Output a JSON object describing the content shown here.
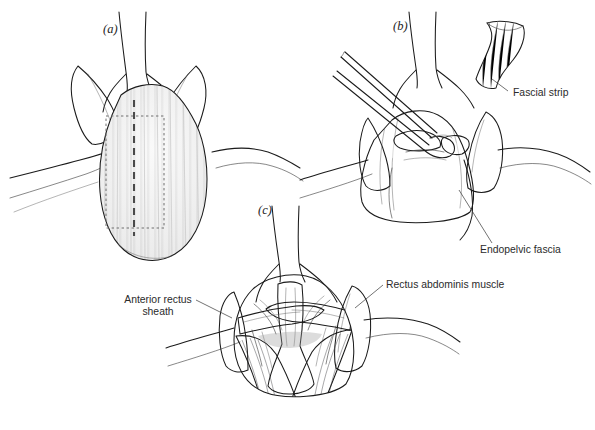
{
  "figure": {
    "kind": "medical-illustration",
    "background_color": "#ffffff",
    "ink_color": "#1b1b1b",
    "label_color": "#2b2b2b",
    "width": 595,
    "height": 430
  },
  "panels": [
    {
      "id": "a",
      "letter": "(a)",
      "letter_x": 103,
      "letter_y": 33,
      "caption_role": "Exposure of anterior rectus sheath with outlined fascial strip to be harvested",
      "features": [
        "anterior rectus sheath",
        "dotted harvest outline",
        "bold dashed midline incision",
        "retracted subcutaneous fat",
        "skin flaps"
      ]
    },
    {
      "id": "b",
      "letter": "(b)",
      "letter_x": 393,
      "letter_y": 30,
      "caption_role": "Harvested fascial strip removed; clamp passed beneath endopelvic fascia",
      "features": [
        "fascial strip specimen",
        "surgical clamp",
        "endopelvic fascia",
        "bladder dome"
      ]
    },
    {
      "id": "c",
      "letter": "(c)",
      "letter_x": 258,
      "letter_y": 214,
      "caption_role": "Fascial slings passed around the urethra between the rectus abdominis muscles",
      "features": [
        "two fascial sling arms crossing urethra",
        "rectus abdominis muscle bellies",
        "anterior rectus sheath edges",
        "urethra and bladder neck"
      ]
    }
  ],
  "annotations": [
    {
      "id": "fascial-strip",
      "text": "Fascial strip",
      "text_x": 513,
      "text_y": 96,
      "anchor": "start",
      "leader": "M 508 91 L 492 79 L 492 79",
      "points_to": "harvested strip of rectus fascia in panel b"
    },
    {
      "id": "endopelvic-fascia",
      "text": "Endopelvic fascia",
      "text_x": 480,
      "text_y": 253,
      "anchor": "start",
      "leader": "M 492 243 L 459 190",
      "points_to": "endopelvic fascia lateral to bladder neck in panel b"
    },
    {
      "id": "anterior-rectus-sheath",
      "text_line_1": "Anterior rectus",
      "text_line_2": "sheath",
      "text_x": 158,
      "text_y": 303,
      "anchor": "middle",
      "leader": "M 196 300 L 232 318",
      "points_to": "cut edge of anterior rectus sheath in panel c"
    },
    {
      "id": "rectus-abdominis-muscle",
      "text": "Rectus abdominis muscle",
      "text_x": 386,
      "text_y": 288,
      "anchor": "start",
      "leader": "M 383 285 L 355 308",
      "points_to": "rectus abdominis muscle belly in panel c"
    }
  ],
  "palette": {
    "ink": "#1b1b1b",
    "mid_gray": "#8c8c8c",
    "light_gray": "#d8d8d8",
    "muscle_gray": "#6d6d70",
    "tissue_fill": "#f2f2f2",
    "background": "#ffffff"
  }
}
